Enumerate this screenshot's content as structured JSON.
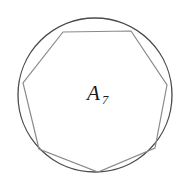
{
  "figure": {
    "caption_label": "A",
    "caption_subscript": "7",
    "background_color": "#ffffff",
    "canvas": {
      "width": 188,
      "height": 182
    }
  },
  "chart_data": {
    "type": "diagram",
    "xlabel": "",
    "ylabel": "",
    "grid": false,
    "legend": "none",
    "xlim": [
      0,
      188
    ],
    "ylim": [
      0,
      182
    ],
    "shapes": [
      {
        "name": "circumscribed-circle",
        "kind": "circle",
        "cx": 95,
        "cy": 95,
        "r": 77,
        "stroke": "#4a4a4a",
        "stroke_width": 1.3,
        "fill": "none"
      },
      {
        "name": "inscribed-heptagon",
        "kind": "polygon",
        "sides": 7,
        "stroke": "#8a8a8a",
        "stroke_width": 1.2,
        "fill": "none",
        "points": [
          [
            63,
            32
          ],
          [
            131,
            31
          ],
          [
            167,
            85
          ],
          [
            155,
            148
          ],
          [
            98,
            172
          ],
          [
            39,
            149
          ],
          [
            23,
            83
          ]
        ]
      }
    ],
    "annotations": [
      {
        "name": "area-label",
        "text": "A",
        "subscript": "7",
        "x": 87,
        "y": 100,
        "subscript_x": 102,
        "subscript_y": 104,
        "color": "#1a1a1a"
      }
    ]
  }
}
